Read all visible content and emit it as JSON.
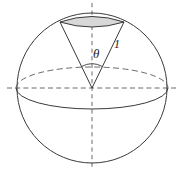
{
  "figure": {
    "type": "geometry-diagram",
    "canvas": {
      "width": 184,
      "height": 173,
      "background": "#ffffff"
    },
    "colors": {
      "stroke": "#3a3a3a",
      "axis": "#5a5a5a",
      "cap_fill": "#d8d8d8",
      "cap_stroke": "#3a3a3a",
      "label": "#1a1a1a"
    },
    "sphere": {
      "name": "unit-sphere",
      "center_x": 92,
      "center_y": 88,
      "radius": 75
    },
    "equator": {
      "name": "equator-ellipse",
      "center_x": 92,
      "center_y": 88,
      "rx": 76,
      "ry": 21,
      "back_half_style": "dashed",
      "front_half_style": "solid"
    },
    "vertical_axis": {
      "name": "vertical-axis",
      "x": 92,
      "y_start": 3,
      "y_end": 169,
      "style": "dashed"
    },
    "horizontal_axis": {
      "name": "horizontal-axis",
      "y": 88,
      "x_start": 7,
      "x_end": 178,
      "style": "dashed"
    },
    "cap": {
      "name": "spherical-cap",
      "left_x": 60,
      "left_y": 22,
      "right_x": 124,
      "right_y": 22,
      "fill": "#d8d8d8",
      "top_arc_sagitta": 9,
      "bottom_arc_sagitta": 8
    },
    "cone": {
      "name": "cone",
      "apex_x": 92,
      "apex_y": 88,
      "left_rim_x": 60,
      "left_rim_y": 22,
      "right_rim_x": 124,
      "right_rim_y": 22
    },
    "angle_arc": {
      "name": "angle-arc",
      "center_x": 92,
      "center_y": 88,
      "radius": 22
    },
    "labels": [
      {
        "name": "theta-label",
        "text": "θ",
        "x": 93,
        "y": 58,
        "font_size": 13,
        "italic": false
      },
      {
        "name": "radius-label",
        "text": "1",
        "x": 114,
        "y": 48,
        "font_size": 12,
        "italic": false
      }
    ]
  }
}
